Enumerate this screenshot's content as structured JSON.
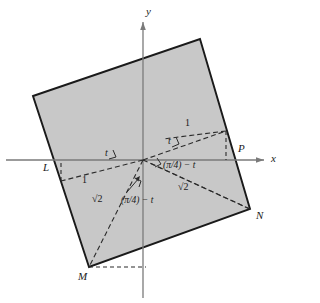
{
  "figure": {
    "kind": "geometry-diagram",
    "colors": {
      "square_fill": "#c8c8c8",
      "square_stroke": "#1a1a1a",
      "axis": "#7a7a7a",
      "dashed": "#2b2b2b",
      "text": "#1a1a1a",
      "background": "#ffffff"
    },
    "axes": {
      "x_label": "x",
      "y_label": "y",
      "origin": {
        "x": 143,
        "y": 160
      }
    },
    "points": [
      {
        "name": "L",
        "label": "L",
        "x": 52,
        "y": 160
      },
      {
        "name": "M",
        "label": "M",
        "x": 89,
        "y": 267
      },
      {
        "name": "N",
        "label": "N",
        "x": 250,
        "y": 209
      },
      {
        "name": "P",
        "label": "P",
        "x": 242,
        "y": 160
      }
    ],
    "square_vertices": [
      {
        "x": 33,
        "y": 96
      },
      {
        "x": 200,
        "y": 39
      },
      {
        "x": 250,
        "y": 209
      },
      {
        "x": 89,
        "y": 267
      }
    ],
    "segment_labels": [
      {
        "id": "one-upper-right",
        "text": "1",
        "x": 187,
        "y": 125
      },
      {
        "id": "one-lower-left",
        "text": "1",
        "x": 84,
        "y": 182
      },
      {
        "id": "sqrt2-right",
        "text": "√2",
        "x": 184,
        "y": 188
      },
      {
        "id": "sqrt2-left",
        "text": "√2",
        "x": 97,
        "y": 200
      }
    ],
    "angle_labels": [
      {
        "id": "t-right",
        "text": "t",
        "x": 170,
        "y": 143
      },
      {
        "id": "t-left",
        "text": "t",
        "x": 107,
        "y": 155
      },
      {
        "id": "pi4-minus-t-right",
        "text": "(π/4) − t",
        "x": 165,
        "y": 157
      },
      {
        "id": "pi4-minus-t-lower",
        "text": "(π/4) − t",
        "x": 124,
        "y": 197
      }
    ]
  }
}
